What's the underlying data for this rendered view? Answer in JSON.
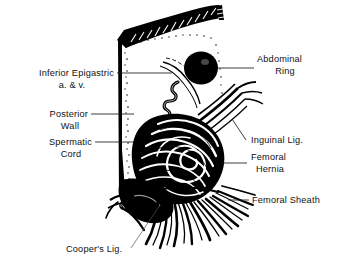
{
  "figure": {
    "background_color": "#ffffff",
    "ink_color": "#000000",
    "label_color": "#111111",
    "width": 339,
    "height": 270
  },
  "labels": {
    "inferior_epigastric_line1": "Inferior Epigastric",
    "inferior_epigastric_line2": "a. & v.",
    "posterior_wall_line1": "Posterior",
    "posterior_wall_line2": "Wall",
    "spermatic_cord_line1": "Spermatic",
    "spermatic_cord_line2": "Cord",
    "abdominal_ring_line1": "Abdominal",
    "abdominal_ring_line2": "Ring",
    "inguinal_ligament": "Inguinal Lig.",
    "femoral_hernia_line1": "Femoral",
    "femoral_hernia_line2": "Hernia",
    "femoral_sheath": "Femoral Sheath",
    "coopers_ligament": "Cooper's Lig."
  },
  "structures": {
    "abdominal_ring": "solid black oval opening in the posterior wall",
    "posterior_wall": "pale stippled sheet forming the left panel",
    "transversus_muscle_band": "dark hatched curved band across the top",
    "spermatic_cord": "coiled vertical cord descending the wall",
    "inferior_epigastric_vessels": "pair of thin curved vessels crossing near the ring",
    "inguinal_ligament": "sweeping fibrous band descending to the right",
    "femoral_hernia": "concentric whorl of fibers forming the hernia sac",
    "femoral_sheath": "fan of splaying fibrous strands below the hernia",
    "coopers_ligament": "dark wedge of pectineal ligament at lower left"
  }
}
